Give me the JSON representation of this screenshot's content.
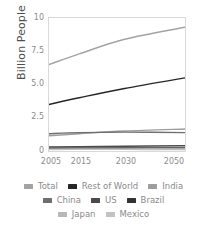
{
  "chart_data": {
    "type": "line",
    "title": "",
    "xlabel": "",
    "ylabel": "Billion People",
    "x": [
      2005,
      2015,
      2030,
      2050
    ],
    "xlim": [
      2005,
      2050
    ],
    "ylim": [
      0,
      10
    ],
    "xticks": [
      "2005",
      "2015",
      "2030",
      "2050"
    ],
    "yticks": [
      "0",
      "2.5",
      "5.0",
      "7.5",
      "10"
    ],
    "grid": false,
    "legend_position": "bottom",
    "series": [
      {
        "name": "Total",
        "values": [
          6.5,
          7.3,
          8.4,
          9.3
        ],
        "color": "#a3a3a3"
      },
      {
        "name": "Rest of World",
        "values": [
          3.5,
          4.0,
          4.7,
          5.5
        ],
        "color": "#262626"
      },
      {
        "name": "India",
        "values": [
          1.15,
          1.3,
          1.5,
          1.65
        ],
        "color": "#9e9e9e"
      },
      {
        "name": "China",
        "values": [
          1.3,
          1.38,
          1.42,
          1.38
        ],
        "color": "#6e6e6e"
      },
      {
        "name": "US",
        "values": [
          0.3,
          0.32,
          0.36,
          0.4
        ],
        "color": "#4a4a4a"
      },
      {
        "name": "Brazil",
        "values": [
          0.19,
          0.21,
          0.23,
          0.23
        ],
        "color": "#333333"
      },
      {
        "name": "Japan",
        "values": [
          0.13,
          0.13,
          0.12,
          0.1
        ],
        "color": "#b8b8b8"
      },
      {
        "name": "Mexico",
        "values": [
          0.11,
          0.13,
          0.14,
          0.15
        ],
        "color": "#c2c2c2"
      }
    ]
  },
  "axis": {
    "y_title": "Billion People",
    "y_ticks": [
      {
        "label": "10",
        "top": 14
      },
      {
        "label": "7.5",
        "top": 47
      },
      {
        "label": "5.0",
        "top": 80
      },
      {
        "label": "2.5",
        "top": 113
      },
      {
        "label": "0",
        "top": 147
      }
    ],
    "x_ticks": [
      {
        "label": "2005",
        "left": 39
      },
      {
        "label": "2015",
        "left": 69
      },
      {
        "label": "2030",
        "left": 114
      },
      {
        "label": "2050",
        "left": 162
      }
    ]
  },
  "legend": {
    "rows": [
      [
        {
          "label": "Total",
          "color": "#a3a3a3"
        },
        {
          "label": "Rest of World",
          "color": "#262626"
        },
        {
          "label": "India",
          "color": "#9e9e9e"
        }
      ],
      [
        {
          "label": "China",
          "color": "#6e6e6e"
        },
        {
          "label": "US",
          "color": "#4a4a4a"
        },
        {
          "label": "Brazil",
          "color": "#333333"
        }
      ],
      [
        {
          "label": "Japan",
          "color": "#b8b8b8"
        },
        {
          "label": "Mexico",
          "color": "#c2c2c2"
        }
      ]
    ]
  }
}
